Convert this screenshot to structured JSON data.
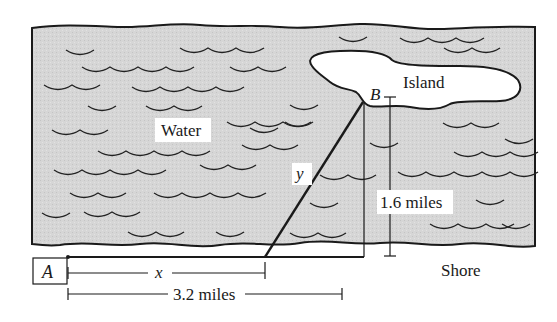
{
  "diagram": {
    "regions": {
      "water": "Water",
      "island": "Island",
      "shore": "Shore"
    },
    "points": {
      "a": "A",
      "b": "B"
    },
    "segments": {
      "x": "x",
      "y": "y"
    },
    "dimensions": {
      "vertical": "1.6 miles",
      "horizontal": "3.2 miles"
    },
    "colors": {
      "water_fill": "#d4d4d4",
      "stroke": "#1a1a1a",
      "island_fill": "#ffffff"
    }
  }
}
